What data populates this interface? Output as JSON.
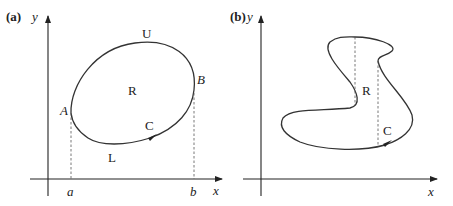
{
  "panel_a": {
    "tag": "(a)",
    "y_axis_label": "y",
    "x_axis_label": "x",
    "region_label": "R",
    "curve_label": "C",
    "upper_label": "U",
    "lower_label": "L",
    "point_A": "A",
    "point_B": "B",
    "tick_a": "a",
    "tick_b": "b"
  },
  "panel_b": {
    "tag": "(b)",
    "y_axis_label": "y",
    "x_axis_label": "x",
    "region_label": "R",
    "curve_label": "C"
  },
  "colors": {
    "stroke": "#333333",
    "background": "#ffffff"
  }
}
